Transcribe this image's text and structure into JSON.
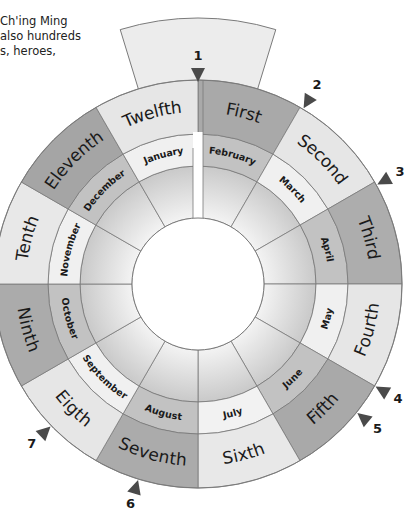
{
  "intro_text": {
    "lines": [
      "Ch'ing Ming",
      "also hundreds",
      "s, heroes,"
    ]
  },
  "wheel": {
    "center": [
      198,
      284
    ],
    "inner_hole_radius": 66,
    "month_ring": [
      118,
      150
    ],
    "ordinal_ring": [
      150,
      204
    ],
    "ordinal_months": [
      {
        "label": "First",
        "start": 0,
        "end": 30,
        "color": "#a9a9a9"
      },
      {
        "label": "Second",
        "start": 30,
        "end": 60,
        "color": "#e6e6e6"
      },
      {
        "label": "Third",
        "start": 60,
        "end": 90,
        "color": "#adadad"
      },
      {
        "label": "Fourth",
        "start": 90,
        "end": 120,
        "color": "#e6e6e6"
      },
      {
        "label": "Fifth",
        "start": 120,
        "end": 150,
        "color": "#a9a9a9"
      },
      {
        "label": "Sixth",
        "start": 150,
        "end": 180,
        "color": "#e8e8e8"
      },
      {
        "label": "Seventh",
        "start": 180,
        "end": 210,
        "color": "#ababab"
      },
      {
        "label": "Eigth",
        "start": 210,
        "end": 240,
        "color": "#e6e6e6"
      },
      {
        "label": "Ninth",
        "start": 240,
        "end": 270,
        "color": "#ababab"
      },
      {
        "label": "Tenth",
        "start": 270,
        "end": 300,
        "color": "#e8e8e8"
      },
      {
        "label": "Eleventh",
        "start": 300,
        "end": 330,
        "color": "#a5a5a5"
      },
      {
        "label": "Twelfth",
        "start": 330,
        "end": 360,
        "color": "#e6e6e6"
      }
    ],
    "calendar_months": [
      {
        "label": "February",
        "start": 0,
        "end": 30,
        "color": "#c2c2c2"
      },
      {
        "label": "March",
        "start": 30,
        "end": 60,
        "color": "#f0f0f0"
      },
      {
        "label": "April",
        "start": 60,
        "end": 90,
        "color": "#c2c2c2"
      },
      {
        "label": "May",
        "start": 90,
        "end": 120,
        "color": "#f0f0f0"
      },
      {
        "label": "June",
        "start": 120,
        "end": 150,
        "color": "#c2c2c2"
      },
      {
        "label": "July",
        "start": 150,
        "end": 180,
        "color": "#f2f2f2"
      },
      {
        "label": "August",
        "start": 180,
        "end": 210,
        "color": "#c2c2c2"
      },
      {
        "label": "September",
        "start": 210,
        "end": 240,
        "color": "#f0f0f0"
      },
      {
        "label": "October",
        "start": 240,
        "end": 270,
        "color": "#c2c2c2"
      },
      {
        "label": "November",
        "start": 270,
        "end": 300,
        "color": "#f0f0f0"
      },
      {
        "label": "December",
        "start": 300,
        "end": 330,
        "color": "#c2c2c2"
      },
      {
        "label": "January",
        "start": 330,
        "end": 360,
        "color": "#f0f0f0"
      }
    ],
    "markers": [
      {
        "label": "1",
        "angle": 0
      },
      {
        "label": "2",
        "angle": 31
      },
      {
        "label": "3",
        "angle": 61
      },
      {
        "label": "4",
        "angle": 120
      },
      {
        "label": "5",
        "angle": 129
      },
      {
        "label": "6",
        "angle": 197
      },
      {
        "label": "7",
        "angle": 226
      }
    ],
    "colors": {
      "stroke": "#7a7a7a",
      "inner_dark": "#c8c8c8",
      "inner_light": "#ececec",
      "tab": "#ececec",
      "marker": "#4a4a4a"
    }
  }
}
